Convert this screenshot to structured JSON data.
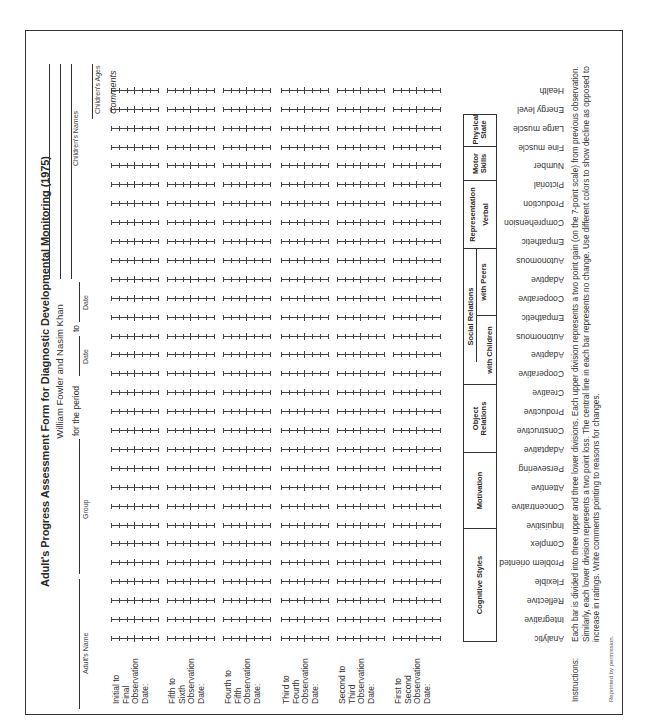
{
  "form": {
    "title": "Adult's Progress Assessment Form for Diagnostic Developmental Monitoring (1975)",
    "authors": "William Fowler and Nasim Khan",
    "fields": {
      "adult_name_label": "Adult's Name",
      "group_label": "Group",
      "period_label": "for the period",
      "date_from_label": "Date",
      "to_label": "to",
      "date_to_label": "Date",
      "children_names_label": "Children's Names",
      "children_ages_label": "Children's Ages",
      "comments_label": "Comments"
    },
    "observation_intervals": [
      "Initial to Final Observation Date:",
      "Fifth to Sixth Observation Date:",
      "Fourth to Fifth Observation Date:",
      "Third to Fourth Observation Date:",
      "Second to Third Observation Date:",
      "First to Second Observation Date:"
    ],
    "observation_intervals_lines": [
      [
        "Initial to",
        "Final",
        "Observation",
        "Date:"
      ],
      [
        "Fifth to",
        "Sixth",
        "Observation",
        "Date:"
      ],
      [
        "Fourth to",
        "Fifth",
        "Observation",
        "Date:"
      ],
      [
        "Third to",
        "Fourth",
        "Observation",
        "Date:"
      ],
      [
        "Second to",
        "Third",
        "Observation",
        "Date:"
      ],
      [
        "First to",
        "Second",
        "Observation",
        "Date:"
      ]
    ],
    "rating_scale": {
      "points": 7,
      "upper_divisions": 3,
      "lower_divisions": 3
    },
    "categories": [
      {
        "label": "Cognitive Styles",
        "sub": "",
        "traits": [
          "Analytic",
          "Integrative",
          "Reflective",
          "Flexible",
          "Problem oriented",
          "Complex"
        ]
      },
      {
        "label": "Motivation",
        "sub": "",
        "traits": [
          "Inquisitive",
          "Concentrative",
          "Attentive",
          "Persevering"
        ]
      },
      {
        "label": "Object Relations",
        "sub": "",
        "traits": [
          "Adaptative",
          "Constructive",
          "Productive",
          "Creative"
        ]
      },
      {
        "label": "Social Relations",
        "sub": "with Children",
        "traits": [
          "Cooperative",
          "Adaptive",
          "Autonomous",
          "Empathetic"
        ]
      },
      {
        "label": "Social Relations",
        "sub": "with Peers",
        "traits": [
          "Cooperative",
          "Adaptive",
          "Autonomous",
          "Empathetic"
        ]
      },
      {
        "label": "Representation",
        "sub": "Verbal",
        "traits": [
          "Comprehension",
          "Production",
          "Pictorial",
          "Number"
        ]
      },
      {
        "label": "Motor Skills",
        "sub": "",
        "traits": [
          "Fine muscle",
          "Large muscle"
        ]
      },
      {
        "label": "Physical State",
        "sub": "",
        "traits": [
          "Energy level",
          "Health"
        ]
      }
    ],
    "header_labels": {
      "cognitive": "Cognitive Styles",
      "motivation": "Motivation",
      "object": "Object Relations",
      "social": "Social Relations",
      "with_children": "with Children",
      "with_peers": "with Peers",
      "representation": "Representation",
      "verbal": "Verbal",
      "motor": "Motor Skills",
      "physical": "Physical State"
    },
    "instructions_label": "Instructions:",
    "instructions_text": "Each bar is divided into three upper and three lower divisions. Each upper division represents a two point gain (on the 7-point scale) from previous observation. Similarly, each lower division represents a two point loss. The central line in each bar represents no change. Use different colors to show decline as opposed to increase in ratings. Write comments pointing to reasons for changes.",
    "footer": "Reprinted by permission."
  }
}
